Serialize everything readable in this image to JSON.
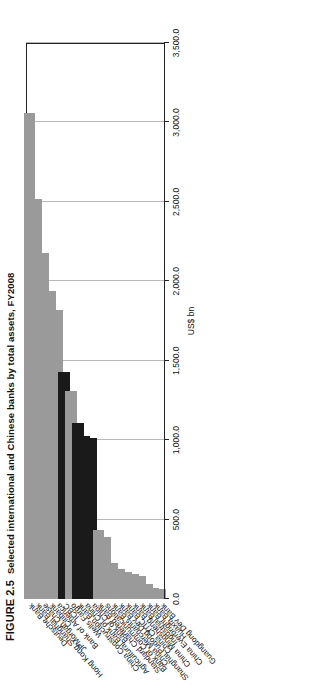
{
  "figure": {
    "number": "FIGURE 2.5",
    "caption": "Selected international and Chinese banks by total assets, FY2008"
  },
  "chart_data": {
    "type": "bar",
    "orientation": "horizontal",
    "title": "Selected international and Chinese banks by total assets, FY2008",
    "xlabel": "",
    "ylabel": "US$ bn",
    "axis_title": "US$ bn",
    "ylim": [
      0,
      3500
    ],
    "grid": true,
    "legend": "none",
    "tick_labels": [
      "3,500.0",
      "3,000.0",
      "2,500.0",
      "2,000.0",
      "1,500.0",
      "1,000.0",
      "500.0",
      "0.0"
    ],
    "tick_values": [
      3500,
      3000,
      2500,
      2000,
      1500,
      1000,
      500,
      0
    ],
    "series_colors": {
      "international": "#9a9a9a",
      "chinese_big_four": "#1a1a1a"
    },
    "categories": [
      "Deutsche Bank",
      "Hong Kong Shanghai Bank",
      "JPMorgan Chase",
      "Citibank",
      "Bank of America",
      "ICBC",
      "Wells Fargo",
      "China Construction Bank",
      "Agricultural Bank of China",
      "Bank of China",
      "Standard Chartered Bank",
      "Bank of Communications",
      "China Merchants Bank",
      "Shanghai Pudong Dev Bank",
      "China CITIC Bank",
      "China Mingsheng Bank",
      "Industrial Bank",
      "China Everbright Bank",
      "Huaxia Bank",
      "Guangdong Dev Bank"
    ],
    "values": [
      3060.0,
      2520.0,
      2175.0,
      1940.0,
      1820.0,
      1430.0,
      1310.0,
      1110.0,
      1025.0,
      1015.0,
      435.0,
      390.0,
      225.0,
      190.0,
      170.0,
      155.0,
      145.0,
      95.0,
      70.0,
      60.0
    ],
    "colors": [
      "international",
      "international",
      "international",
      "international",
      "international",
      "chinese_big_four",
      "international",
      "chinese_big_four",
      "chinese_big_four",
      "chinese_big_four",
      "international",
      "international",
      "international",
      "international",
      "international",
      "international",
      "international",
      "international",
      "international",
      "international"
    ]
  }
}
